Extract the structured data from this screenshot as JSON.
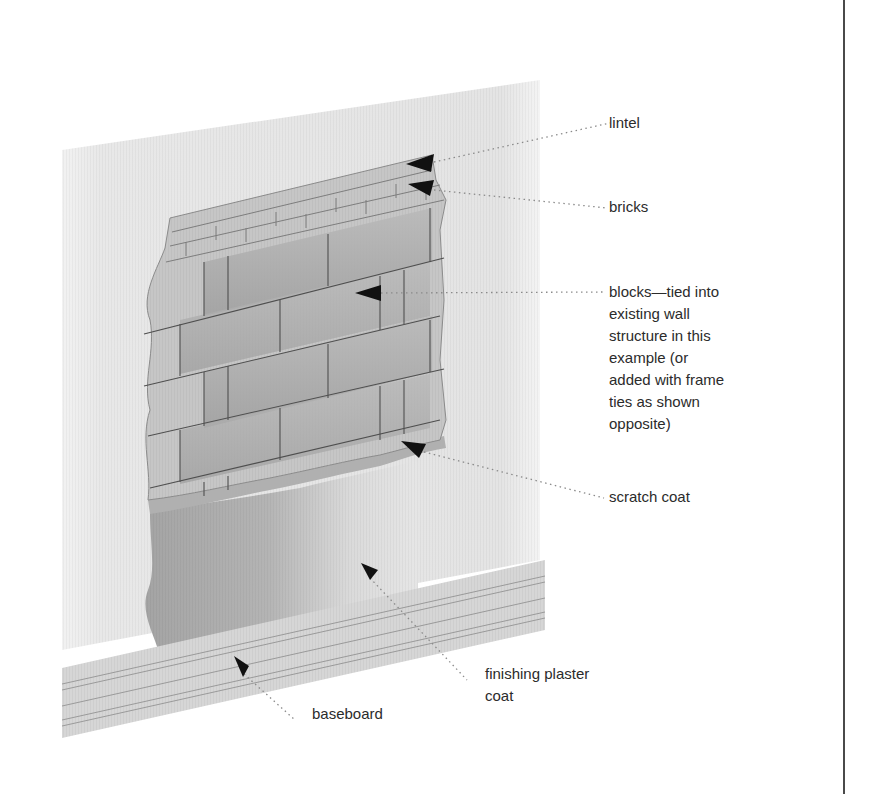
{
  "diagram": {
    "colors": {
      "background": "#ffffff",
      "wall_panel": "#e6e6e6",
      "brick_face": "#c4c4c4",
      "block_dark": "#a9a9a9",
      "block_light": "#cfcfcf",
      "scratch_coat": "#b3b3b3",
      "finishing_plaster": "#a2a2a2",
      "plaster_light": "#dedede",
      "baseboard": "#d2d2d2",
      "baseboard_lines": "#9a9a9a",
      "mortar_lines": "#555555",
      "arrow": "#111111",
      "leader": "#8a8a8a",
      "label_text": "#2b2b2b",
      "rule": "#4a4a4a"
    },
    "labels": [
      {
        "id": "lintel",
        "lines": [
          "lintel"
        ]
      },
      {
        "id": "bricks",
        "lines": [
          "bricks"
        ]
      },
      {
        "id": "blocks",
        "lines": [
          "blocks—tied into",
          "existing wall",
          "structure in this",
          "example (or",
          "added with frame",
          "ties as shown",
          "opposite)"
        ]
      },
      {
        "id": "scratch_coat",
        "lines": [
          "scratch coat"
        ]
      },
      {
        "id": "finishing_plaster_coat",
        "lines": [
          "finishing plaster",
          "coat"
        ]
      },
      {
        "id": "baseboard",
        "lines": [
          "baseboard"
        ]
      }
    ]
  }
}
